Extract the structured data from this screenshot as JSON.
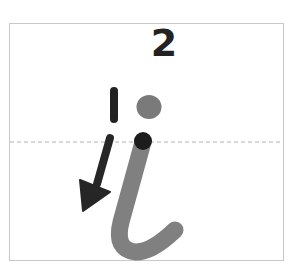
{
  "diagram": {
    "type": "handwriting-stroke-guide",
    "letter": "i",
    "step_number": "2",
    "stroke_order_label": "1",
    "colors": {
      "border": "#c8c8c8",
      "midline": "#b4b4b4",
      "ink": "#222222",
      "stroke_gray": "#808080",
      "dot_gray": "#7a7a7a",
      "start_dot": "#1c1c1c"
    },
    "elements": [
      {
        "name": "step-number",
        "text": "2"
      },
      {
        "name": "stroke-order-mark",
        "text": "1"
      },
      {
        "name": "letter-dot",
        "description": "gray dot of letter i"
      },
      {
        "name": "start-point",
        "description": "black dot marking stroke start"
      },
      {
        "name": "letter-stroke",
        "description": "gray curved stroke of letter i"
      },
      {
        "name": "direction-arrow",
        "description": "black arrow pointing down-left"
      },
      {
        "name": "midline",
        "description": "dashed guide line"
      }
    ]
  }
}
